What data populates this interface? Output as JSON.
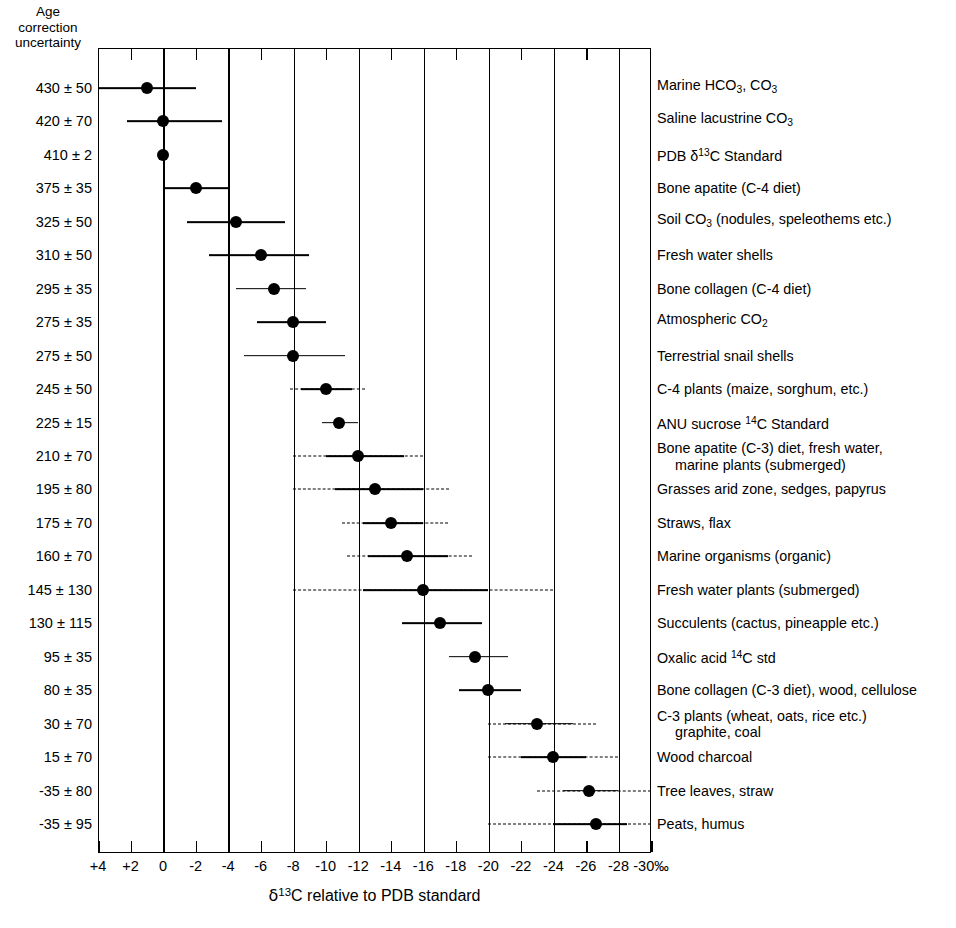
{
  "axis_caption": [
    "Age",
    "correction",
    "uncertainty"
  ],
  "xlabel_parts": {
    "delta": "δ",
    "sup": "13",
    "rest": "C relative to PDB standard"
  },
  "xlabel_text": "δ13C relative to PDB standard",
  "xaxis": {
    "ticklabels": [
      "+4",
      "+2",
      "0",
      "-2",
      "-4",
      "-6",
      "-8",
      "-10",
      "-12",
      "-14",
      "-16",
      "-18",
      "-20",
      "-22",
      "-24",
      "-26",
      "-28",
      "-30‰"
    ],
    "tickvalues": [
      4,
      2,
      0,
      -2,
      -4,
      -6,
      -8,
      -10,
      -12,
      -14,
      -16,
      -18,
      -20,
      -22,
      -24,
      -26,
      -28,
      -30
    ],
    "gridline_values": [
      4,
      0,
      -4,
      -8,
      -12,
      -16,
      -20,
      -24,
      -28
    ],
    "min": 4,
    "max": -30,
    "unit": "‰"
  },
  "chart_data": {
    "type": "scatter",
    "title": "",
    "xlabel": "δ13C relative to PDB standard",
    "ylabel": "Age correction uncertainty",
    "xlim": [
      4,
      -30
    ],
    "grid": true,
    "legend": "none",
    "columns": [
      "age_correction_uncertainty",
      "material",
      "delta13C_center",
      "solid_low",
      "solid_high",
      "dashed_low",
      "dashed_high"
    ],
    "rows": [
      {
        "age": "430 ± 50",
        "age_value": 430,
        "age_err": 50,
        "material": "Marine HCO3, CO3",
        "material_html": "Marine HCO<sub>3</sub>, CO<sub>3</sub>",
        "center": 1.0,
        "solid": [
          4.0,
          -2.0
        ],
        "dashed": null
      },
      {
        "age": "420 ± 70",
        "age_value": 420,
        "age_err": 70,
        "material": "Saline lacustrine CO3",
        "material_html": "Saline lacustrine CO<sub>3</sub>",
        "center": 0.0,
        "solid": [
          2.2,
          -3.6
        ],
        "dashed": null
      },
      {
        "age": "410 ± 2",
        "age_value": 410,
        "age_err": 2,
        "material": "PDB δ13C Standard",
        "material_html": "PDB δ<sup>13</sup>C Standard",
        "center": 0.0,
        "solid": [
          0.0,
          0.0
        ],
        "dashed": null
      },
      {
        "age": "375 ± 35",
        "age_value": 375,
        "age_err": 35,
        "material": "Bone apatite (C-4 diet)",
        "material_html": "Bone apatite (C-4 diet)",
        "center": -2.0,
        "solid": [
          0.0,
          -4.0
        ],
        "dashed": null
      },
      {
        "age": "325 ± 50",
        "age_value": 325,
        "age_err": 50,
        "material": "Soil CO3 (nodules, speleothems etc.)",
        "material_html": "Soil CO<sub>3</sub> (nodules, speleothems etc.)",
        "center": -4.5,
        "solid": [
          -1.5,
          -7.5
        ],
        "dashed": null
      },
      {
        "age": "310 ± 50",
        "age_value": 310,
        "age_err": 50,
        "material": "Fresh water shells",
        "material_html": "Fresh water shells",
        "center": -6.0,
        "solid": [
          -2.8,
          -9.0
        ],
        "dashed": null
      },
      {
        "age": "295 ± 35",
        "age_value": 295,
        "age_err": 35,
        "material": "Bone collagen (C-4 diet)",
        "material_html": "Bone collagen (C-4 diet)",
        "center": -6.8,
        "solid": [
          -4.5,
          -8.8
        ],
        "dashed": null
      },
      {
        "age": "275 ± 35",
        "age_value": 275,
        "age_err": 35,
        "material": "Atmospheric CO2",
        "material_html": "Atmospheric CO<sub>2</sub>",
        "center": -8.0,
        "solid": [
          -5.8,
          -10.0
        ],
        "dashed": null
      },
      {
        "age": "275 ± 50",
        "age_value": 275,
        "age_err": 50,
        "material": "Terrestrial snail shells",
        "material_html": "Terrestrial snail shells",
        "center": -8.0,
        "solid": [
          -5.0,
          -11.2
        ],
        "dashed": null
      },
      {
        "age": "245 ± 50",
        "age_value": 245,
        "age_err": 50,
        "material": "C-4 plants (maize, sorghum, etc.)",
        "material_html": "C-4 plants (maize, sorghum, etc.)",
        "center": -10.0,
        "solid": [
          -8.5,
          -11.6
        ],
        "dashed": [
          -7.8,
          -12.4
        ]
      },
      {
        "age": "225 ± 15",
        "age_value": 225,
        "age_err": 15,
        "material": "ANU sucrose 14C Standard",
        "material_html": "ANU sucrose <sup>14</sup>C Standard",
        "center": -10.8,
        "solid": [
          -9.8,
          -12.0
        ],
        "dashed": null
      },
      {
        "age": "210 ± 70",
        "age_value": 210,
        "age_err": 70,
        "material": "Bone apatite (C-3) diet, fresh water, marine plants (submerged)",
        "material_html": "Bone apatite (C-3) diet, fresh water,<span class=\"ind\">marine plants (submerged)</span>",
        "center": -12.0,
        "solid": [
          -10.0,
          -14.8
        ],
        "dashed": [
          -8.0,
          -16.0
        ]
      },
      {
        "age": "195 ± 80",
        "age_value": 195,
        "age_err": 80,
        "material": "Grasses arid zone, sedges, papyrus",
        "material_html": "Grasses arid zone, sedges, papyrus",
        "center": -13.0,
        "solid": [
          -10.6,
          -16.0
        ],
        "dashed": [
          -8.0,
          -17.6
        ]
      },
      {
        "age": "175 ± 70",
        "age_value": 175,
        "age_err": 70,
        "material": "Straws, flax",
        "material_html": "Straws, flax",
        "center": -14.0,
        "solid": [
          -12.3,
          -16.0
        ],
        "dashed": [
          -11.0,
          -17.5
        ]
      },
      {
        "age": "160 ± 70",
        "age_value": 160,
        "age_err": 70,
        "material": "Marine organisms (organic)",
        "material_html": "Marine organisms (organic)",
        "center": -15.0,
        "solid": [
          -12.6,
          -17.5
        ],
        "dashed": [
          -11.3,
          -19.0
        ]
      },
      {
        "age": "145 ± 130",
        "age_value": 145,
        "age_err": 130,
        "material": "Fresh water plants (submerged)",
        "material_html": "Fresh water plants (submerged)",
        "center": -16.0,
        "solid": [
          -12.3,
          -20.0
        ],
        "dashed": [
          -8.0,
          -24.0
        ]
      },
      {
        "age": "130 ± 115",
        "age_value": 130,
        "age_err": 115,
        "material": "Succulents (cactus, pineapple etc.)",
        "material_html": "Succulents (cactus, pineapple etc.)",
        "center": -17.0,
        "solid": [
          -14.7,
          -19.6
        ],
        "dashed": null
      },
      {
        "age": "95 ± 35",
        "age_value": 95,
        "age_err": 35,
        "material": "Oxalic acid 14C std",
        "material_html": "Oxalic acid <sup>14</sup>C std",
        "center": -19.2,
        "solid": [
          -17.6,
          -21.2
        ],
        "dashed": null
      },
      {
        "age": "80 ± 35",
        "age_value": 80,
        "age_err": 35,
        "material": "Bone collagen (C-3 diet), wood, cellulose",
        "material_html": "Bone collagen (C-3 diet), wood, cellulose",
        "center": -20.0,
        "solid": [
          -18.2,
          -22.0
        ],
        "dashed": null
      },
      {
        "age": "30 ± 70",
        "age_value": 30,
        "age_err": 70,
        "material": "C-3 plants (wheat, oats, rice etc.) graphite, coal",
        "material_html": "C-3 plants (wheat, oats, rice etc.)<span class=\"ind\">graphite, coal</span>",
        "center": -23.0,
        "solid": [
          -21.0,
          -25.2
        ],
        "dashed": [
          -20.0,
          -26.6
        ]
      },
      {
        "age": "15 ± 70",
        "age_value": 15,
        "age_err": 70,
        "material": "Wood charcoal",
        "material_html": "Wood charcoal",
        "center": -24.0,
        "solid": [
          -22.0,
          -26.0
        ],
        "dashed": [
          -20.0,
          -28.0
        ]
      },
      {
        "age": "-35 ± 80",
        "age_value": -35,
        "age_err": 80,
        "material": "Tree leaves, straw",
        "material_html": "Tree leaves, straw",
        "center": -26.2,
        "solid": [
          -24.6,
          -28.0
        ],
        "dashed": [
          -23.0,
          -30.0
        ]
      },
      {
        "age": "-35 ± 95",
        "age_value": -35,
        "age_err": 95,
        "material": "Peats, humus",
        "material_html": "Peats, humus",
        "center": -26.6,
        "solid": [
          -24.0,
          -28.5
        ],
        "dashed": [
          -20.0,
          -30.0
        ]
      }
    ]
  }
}
